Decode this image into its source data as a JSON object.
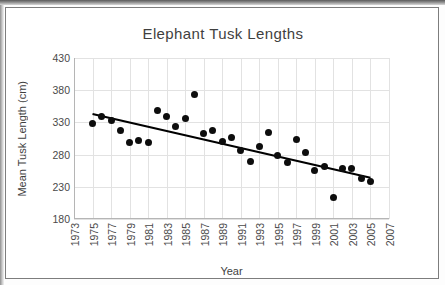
{
  "chart_data": {
    "type": "scatter",
    "title": "Elephant Tusk Lengths",
    "xlabel": "Year",
    "ylabel": "Mean Tusk Length (cm)",
    "xlim": [
      1973,
      2007
    ],
    "ylim": [
      180,
      430
    ],
    "xticks": [
      1973,
      1975,
      1977,
      1979,
      1981,
      1983,
      1985,
      1987,
      1989,
      1991,
      1993,
      1995,
      1997,
      1999,
      2001,
      2003,
      2005,
      2007
    ],
    "yticks": [
      180,
      230,
      280,
      330,
      380,
      430
    ],
    "grid": true,
    "legend": false,
    "marker_color": "#0d0d0d",
    "trendline_color": "#000000",
    "series": [
      {
        "name": "Mean Tusk Length",
        "x": [
          1975,
          1976,
          1977,
          1978,
          1979,
          1980,
          1981,
          1982,
          1983,
          1984,
          1985,
          1986,
          1987,
          1988,
          1989,
          1990,
          1991,
          1992,
          1993,
          1994,
          1995,
          1996,
          1997,
          1998,
          1999,
          2000,
          2001,
          2002,
          2003,
          2004,
          2005
        ],
        "y": [
          329,
          339,
          333,
          317,
          299,
          302,
          299,
          349,
          339,
          324,
          336,
          374,
          312,
          317,
          301,
          306,
          287,
          270,
          292,
          314,
          279,
          268,
          303,
          284,
          256,
          262,
          213,
          258,
          258,
          243,
          238
        ]
      }
    ],
    "trendline": {
      "type": "linear",
      "x_start": 1975,
      "y_start": 343,
      "x_end": 2005,
      "y_end": 244
    }
  }
}
